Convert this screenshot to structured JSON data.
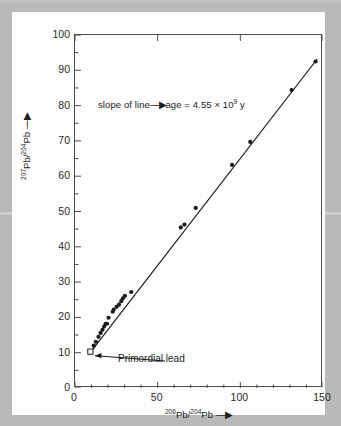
{
  "figure": {
    "page_background_color": "#b9b9b9",
    "card_background_color": "#fdfdfd",
    "axis_color": "#4c4c4c",
    "data_color": "#1a1a1a"
  },
  "annotations": {
    "slope": {
      "lead_text": "slope of line",
      "arrow": "──▶",
      "trail_text_pre": "age = 4.55 × 10",
      "trail_exponent": "9",
      "trail_text_post": " y",
      "full_text": "slope of line ─▶ age = 4.55 × 10⁹ y"
    },
    "primordial_lead": {
      "label": "Primordial lead",
      "point_x": 9.3,
      "point_y": 10.3,
      "marker": "open-square"
    }
  },
  "axes": {
    "y_title_pre": "207",
    "y_title_mid": "Pb/",
    "y_title_sup2": "204",
    "y_title_end": "Pb",
    "y_title_arrow": "──▶",
    "x_title_pre": "206",
    "x_title_mid": "Pb/",
    "x_title_sup2": "204",
    "x_title_end": "Pb",
    "x_title_arrow": "──▶"
  },
  "chart_data": {
    "type": "scatter",
    "title": "",
    "subtitle": "",
    "xlabel": "206Pb/204Pb",
    "ylabel": "207Pb/204Pb",
    "xlim": [
      0,
      150
    ],
    "ylim": [
      0,
      100
    ],
    "grid": false,
    "legend": null,
    "x_major_ticks": [
      0,
      50,
      100,
      150
    ],
    "x_major_tick_labels": [
      "0",
      "50",
      "100",
      "150"
    ],
    "x_minor_tick_step": 10,
    "y_major_ticks": [
      0,
      10,
      20,
      30,
      40,
      50,
      60,
      70,
      80,
      90,
      100
    ],
    "y_major_tick_labels": [
      "0",
      "10",
      "20",
      "30",
      "40",
      "50",
      "60",
      "70",
      "80",
      "90",
      "100"
    ],
    "series": [
      {
        "name": "Meteorite and terrestrial lead",
        "marker": "filled-circle",
        "x": [
          9.3,
          11.3,
          12.6,
          14.2,
          15.5,
          16.6,
          17.6,
          18.5,
          19.4,
          20.3,
          22.8,
          23.4,
          25.2,
          26.6,
          28.0,
          29.0,
          30.2,
          34.0,
          64.0,
          66.2,
          73.0,
          95.0,
          106.0,
          131.0,
          145.5
        ],
        "y": [
          10.3,
          12.0,
          13.1,
          14.5,
          15.6,
          16.5,
          17.4,
          18.2,
          18.2,
          19.9,
          21.6,
          22.2,
          23.0,
          23.6,
          24.6,
          25.4,
          26.1,
          27.2,
          45.5,
          46.3,
          51.0,
          63.2,
          69.7,
          84.4,
          92.5
        ]
      }
    ],
    "fit_line": {
      "name": "isochron",
      "x": [
        8.5,
        146.5
      ],
      "y": [
        9.6,
        93.2
      ],
      "slope_age_gy": 4.55
    }
  }
}
